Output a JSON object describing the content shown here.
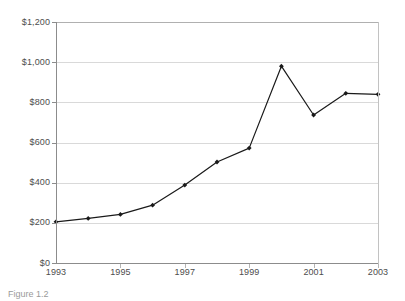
{
  "figure": {
    "caption": "Figure 1.2"
  },
  "chart_data": {
    "type": "line",
    "title": "",
    "xlabel": "",
    "ylabel": "",
    "x": [
      1993,
      1994,
      1995,
      1996,
      1997,
      1998,
      1999,
      2000,
      2001,
      2002,
      2003
    ],
    "values": [
      205,
      222,
      242,
      288,
      388,
      503,
      572,
      980,
      737,
      845,
      840
    ],
    "series": [
      {
        "name": "",
        "values": [
          205,
          222,
          242,
          288,
          388,
          503,
          572,
          980,
          737,
          845,
          840
        ]
      }
    ],
    "xlim": [
      1993,
      2003
    ],
    "ylim": [
      0,
      1200
    ],
    "y_ticks": [
      0,
      200,
      400,
      600,
      800,
      1000,
      1200
    ],
    "y_tick_labels": [
      "$0",
      "$200",
      "$400",
      "$600",
      "$800",
      "$1,000",
      "$1,200"
    ],
    "x_ticks": [
      1993,
      1995,
      1997,
      1999,
      2001,
      2003
    ],
    "x_tick_labels": [
      "1993",
      "1995",
      "1997",
      "1999",
      "2001",
      "2003"
    ],
    "grid": "horizontal",
    "legend": "none",
    "line_color": "#1a1a1a",
    "marker": "diamond",
    "marker_color": "#1a1a1a",
    "gridline_color": "#d9d9d9",
    "axis_color": "#8c8c8c",
    "tick_label_color": "#4d4d4d",
    "background_color": "#ffffff"
  }
}
